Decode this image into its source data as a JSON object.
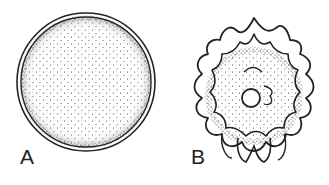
{
  "figure": {
    "panels": [
      {
        "label": "A",
        "description": "smooth spherical cell with double wall and stippled interior"
      },
      {
        "label": "B",
        "description": "spiny/undulating cell with wavy projections, stippled interior and central nucleus"
      }
    ],
    "ink_color": "#222222",
    "background": "#ffffff"
  }
}
